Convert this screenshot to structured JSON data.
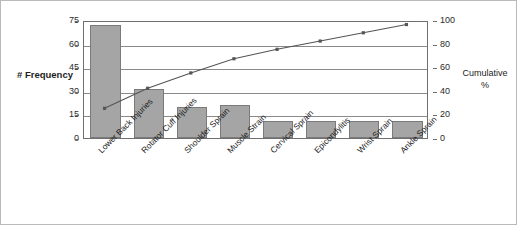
{
  "chart_data": {
    "type": "bar",
    "title": "",
    "subtitle": "",
    "xlabel": "",
    "ylabel": "# Frequency",
    "y2label": "Cumulative %",
    "grid": true,
    "legend": "none",
    "categories": [
      "Lower Back Injuries",
      "Rotator Cuff Injuries",
      "Shoulder Sprain",
      "Muscle Strain",
      "Cervical Sprain",
      "Epicondylitis",
      "Wrist Sprain",
      "Ankle Sprain"
    ],
    "values": [
      72,
      31,
      20,
      21,
      11,
      11,
      11,
      11
    ],
    "ylim": [
      0,
      75
    ],
    "yticks": [
      0,
      15,
      30,
      45,
      60,
      75
    ],
    "y2lim": [
      0,
      100
    ],
    "y2ticks": [
      0,
      20,
      40,
      60,
      80,
      100
    ],
    "series": [
      {
        "name": "# Frequency",
        "type": "bar",
        "axis": "left",
        "color": "#a5a5a5",
        "values": [
          72,
          31,
          20,
          21,
          11,
          11,
          11,
          11
        ]
      },
      {
        "name": "Cumulative %",
        "type": "line",
        "axis": "right",
        "color": "#555555",
        "values": [
          26,
          43,
          56,
          68,
          76,
          83,
          90,
          97
        ]
      }
    ]
  },
  "axes": {
    "left": {
      "title": "# Frequency",
      "ticks": [
        "75",
        "60",
        "45",
        "30",
        "15",
        "0"
      ]
    },
    "right": {
      "title_line1": "Cumulative",
      "title_line2": "%",
      "ticks": [
        "100",
        "80",
        "60",
        "40",
        "20",
        "0"
      ]
    }
  }
}
